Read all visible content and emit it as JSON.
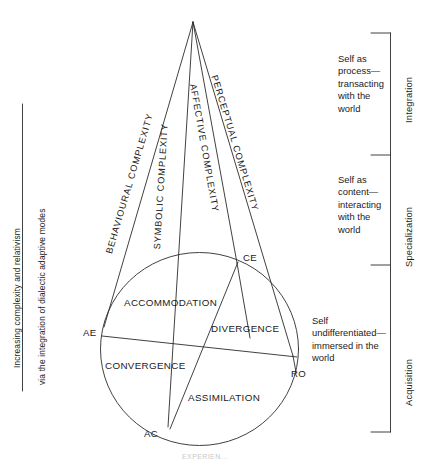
{
  "figure": {
    "title_caption": "EXPERIEN...",
    "left_axis": {
      "line1": "Increasing complexity and relativism",
      "line2": "via the integration of dialectic adaptive modes"
    },
    "apex": {
      "x": 193,
      "y": 22
    },
    "cone_labels": [
      {
        "name": "behavioural-complexity",
        "text": "BEHAVIOURAL COMPLEXITY"
      },
      {
        "name": "symbolic-complexity",
        "text": "SYMBOLIC COMPLEXITY"
      },
      {
        "name": "affective-complexity",
        "text": "AFFECTIVE COMPLEXITY"
      },
      {
        "name": "perceptual-complexity",
        "text": "PERCEPTUAL COMPLEXITY"
      }
    ],
    "nodes": [
      {
        "name": "ce",
        "label": "CE",
        "x": 238,
        "y": 262
      },
      {
        "name": "ae",
        "label": "AE",
        "x": 105,
        "y": 338
      },
      {
        "name": "ro",
        "label": "RO",
        "x": 293,
        "y": 357
      },
      {
        "name": "ac",
        "label": "AC",
        "x": 170,
        "y": 428
      }
    ],
    "quadrants": [
      {
        "name": "accommodation",
        "label": "ACCOMMODATION"
      },
      {
        "name": "divergence",
        "label": "DIVERGENCE"
      },
      {
        "name": "convergence",
        "label": "CONVERGENCE"
      },
      {
        "name": "assimilation",
        "label": "ASSIMILATION"
      }
    ],
    "stages": [
      {
        "name": "integration",
        "phase": "Integration",
        "description": "Self as\nprocess—\ntransacting\nwith the\nworld"
      },
      {
        "name": "specialization",
        "phase": "Specialization",
        "description": "Self as\ncontent—\ninteracting\nwith the\nworld"
      },
      {
        "name": "acquisition",
        "phase": "Acquisition",
        "description": "Self\nundifferentiated—\nimmersed in the\nworld"
      }
    ],
    "colors": {
      "stroke": "#2b2b2b",
      "text": "#1a1a1a",
      "background": "#ffffff"
    }
  }
}
